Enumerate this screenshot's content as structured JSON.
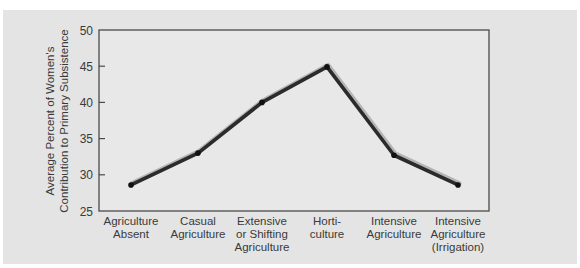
{
  "chart_data": {
    "type": "line",
    "title": "",
    "xlabel": "",
    "ylabel": "Average Percent of Women's Contribution to Primary Subsistence",
    "ylabel_lines": [
      "Average Percent of Women's",
      "Contribution to Primary Subsistence"
    ],
    "ylim": [
      25,
      50
    ],
    "yticks": [
      25,
      30,
      35,
      40,
      45,
      50
    ],
    "grid": false,
    "legend": null,
    "categories": [
      "Agriculture Absent",
      "Casual Agriculture",
      "Extensive or Shifting Agriculture",
      "Horti-culture",
      "Intensive Agriculture",
      "Intensive Agriculture (Irrigation)"
    ],
    "category_lines": [
      [
        "Agriculture",
        "Absent"
      ],
      [
        "Casual",
        "Agriculture"
      ],
      [
        "Extensive",
        "or Shifting",
        "Agriculture"
      ],
      [
        "Horti-",
        "culture"
      ],
      [
        "Intensive",
        "Agriculture"
      ],
      [
        "Intensive",
        "Agriculture",
        "(Irrigation)"
      ]
    ],
    "series": [
      {
        "name": "Women's contribution",
        "values": [
          28.6,
          33.0,
          40.0,
          44.9,
          32.7,
          28.6
        ]
      }
    ],
    "colors": {
      "line": "#2b2b2b",
      "line_shadow": "#b5b5b5",
      "panel": "#e4e4e4",
      "plot_bg": "#e8e8e8",
      "axis": "#4a4a4a"
    }
  }
}
